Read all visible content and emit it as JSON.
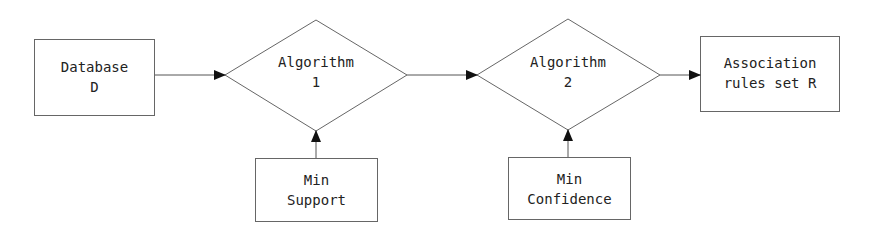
{
  "nodes": {
    "database": {
      "line1": "Database",
      "line2": "D"
    },
    "algorithm1": {
      "line1": "Algorithm",
      "line2": "1"
    },
    "algorithm2": {
      "line1": "Algorithm",
      "line2": "2"
    },
    "rules": {
      "line1": "Association",
      "line2": "rules set R"
    },
    "min_support": {
      "line1": "Min",
      "line2": "Support"
    },
    "min_confidence": {
      "line1": "Min",
      "line2": "Confidence"
    }
  },
  "edges": [
    {
      "from": "database",
      "to": "algorithm1"
    },
    {
      "from": "algorithm1",
      "to": "algorithm2"
    },
    {
      "from": "algorithm2",
      "to": "rules"
    },
    {
      "from": "min_support",
      "to": "algorithm1"
    },
    {
      "from": "min_confidence",
      "to": "algorithm2"
    }
  ],
  "colors": {
    "stroke": "#555555",
    "arrow": "#111111",
    "text": "#222222"
  }
}
